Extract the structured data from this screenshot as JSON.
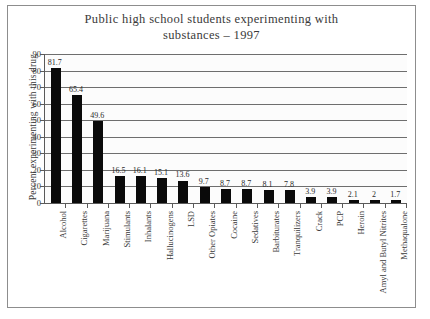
{
  "chart_data": {
    "type": "bar",
    "title": "Public high school students experimenting with\nsubstances – 1997",
    "xlabel": "",
    "ylabel": "Percent experimenting with this drug",
    "ylim": [
      0,
      90
    ],
    "ytick_step": 10,
    "yticks": [
      "90",
      "80",
      "70",
      "60",
      "50",
      "40",
      "30",
      "20",
      "10",
      "0"
    ],
    "grid": true,
    "legend": "none",
    "bar_color": "#0a0a0a",
    "categories": [
      "Alcohol",
      "Cigarettes",
      "Marijuana",
      "Stimulants",
      "Inhalants",
      "Hallucinogens",
      "LSD",
      "Other Opiates",
      "Cocaine",
      "Sedatives",
      "Barbiturates",
      "Tranquilizers",
      "Crack",
      "PCP",
      "Heroin",
      "Amyl and Butyl Nitrites",
      "Methaqualone"
    ],
    "values": [
      81.7,
      65.4,
      49.6,
      16.5,
      16.1,
      15.1,
      13.6,
      9.7,
      8.7,
      8.7,
      8.1,
      7.8,
      3.9,
      3.9,
      2.1,
      2,
      1.7
    ],
    "value_labels": [
      "81.7",
      "65.4",
      "49.6",
      "16.5",
      "16.1",
      "15.1",
      "13.6",
      "9.7",
      "8.7",
      "8.7",
      "8.1",
      "7.8",
      "3.9",
      "3.9",
      "2.1",
      "2",
      "1.7"
    ]
  }
}
